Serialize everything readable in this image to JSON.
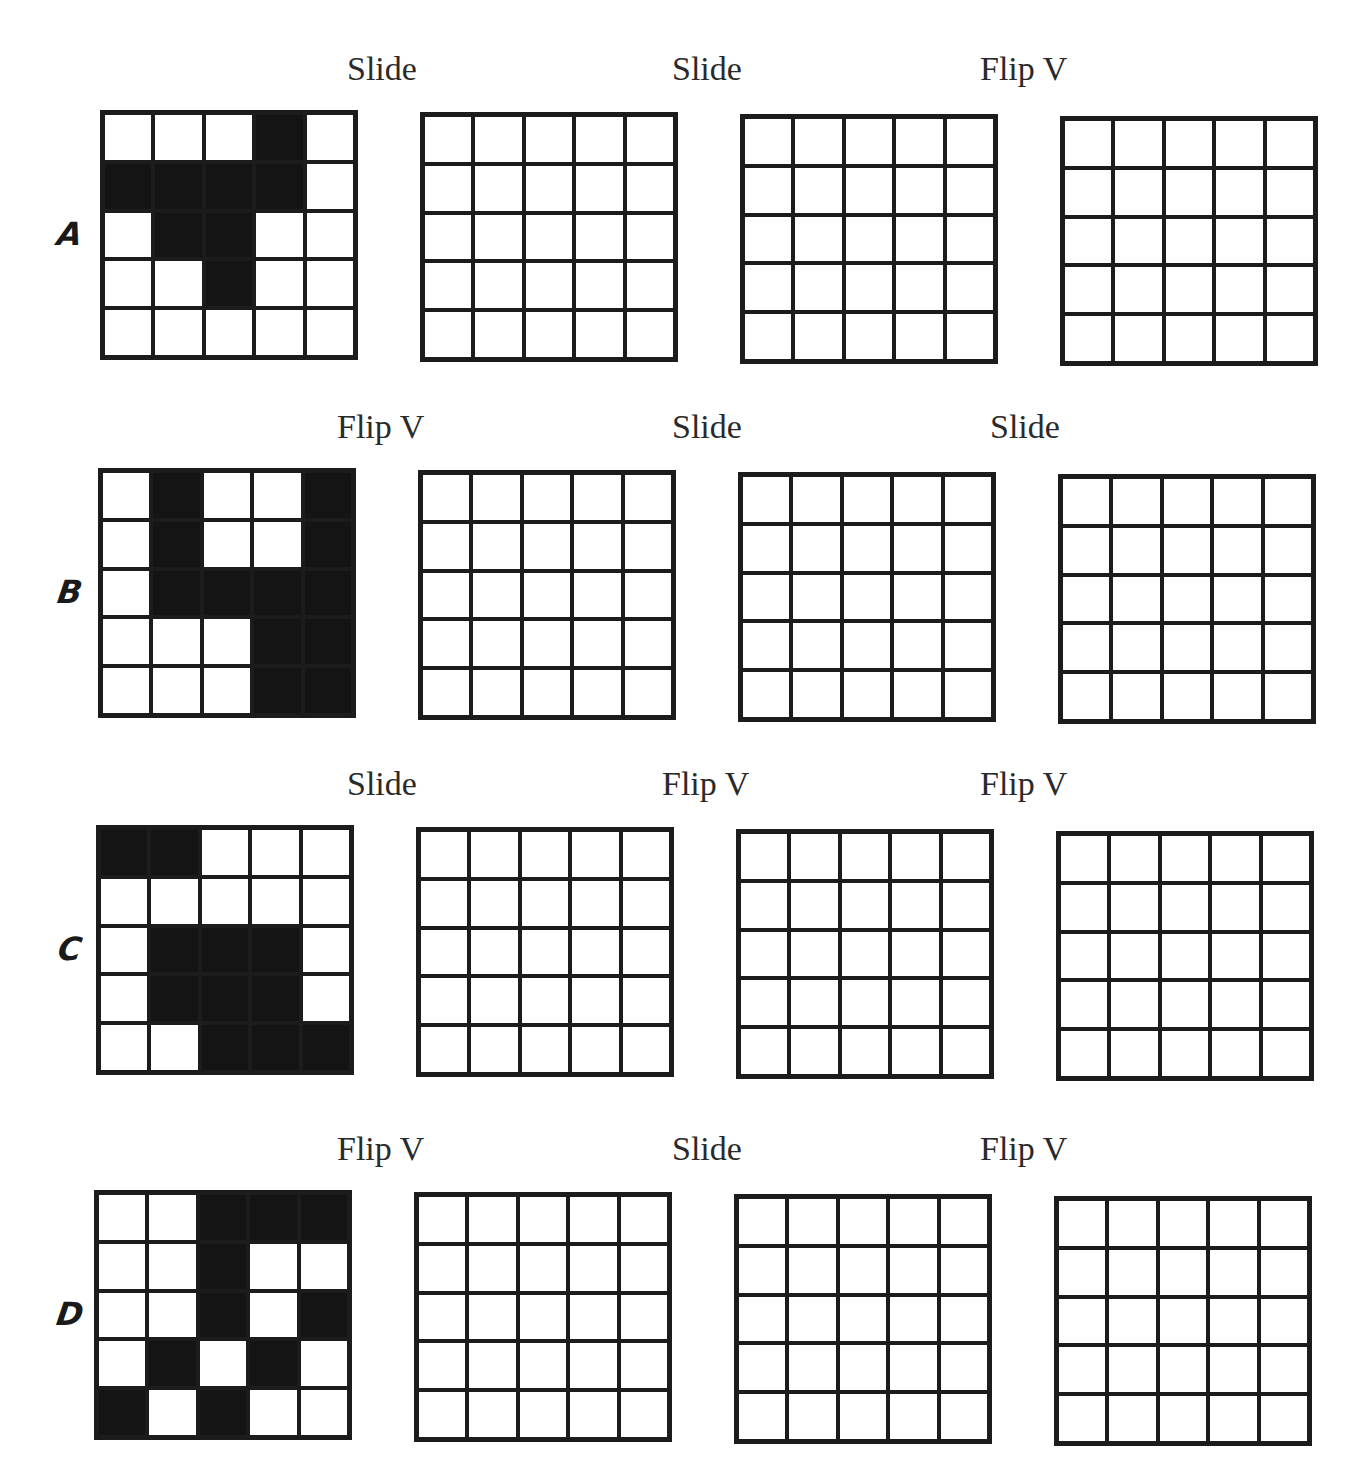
{
  "worksheet": {
    "rows": [
      {
        "letter": "A",
        "operations": [
          "Slide",
          "Slide",
          "Flip V"
        ],
        "start_pattern": [
          [
            0,
            0,
            0,
            1,
            0
          ],
          [
            1,
            1,
            1,
            1,
            0
          ],
          [
            0,
            1,
            1,
            0,
            0
          ],
          [
            0,
            0,
            1,
            0,
            0
          ],
          [
            0,
            0,
            0,
            0,
            0
          ]
        ]
      },
      {
        "letter": "B",
        "operations": [
          "Flip V",
          "Slide",
          "Slide"
        ],
        "start_pattern": [
          [
            0,
            1,
            0,
            0,
            1
          ],
          [
            0,
            1,
            0,
            0,
            1
          ],
          [
            0,
            1,
            1,
            1,
            1
          ],
          [
            0,
            0,
            0,
            1,
            1
          ],
          [
            0,
            0,
            0,
            1,
            1
          ]
        ]
      },
      {
        "letter": "C",
        "operations": [
          "Slide",
          "Flip V",
          "Flip V"
        ],
        "start_pattern": [
          [
            1,
            1,
            0,
            0,
            0
          ],
          [
            0,
            0,
            0,
            0,
            0
          ],
          [
            0,
            1,
            1,
            1,
            0
          ],
          [
            0,
            1,
            1,
            1,
            0
          ],
          [
            0,
            0,
            1,
            1,
            1
          ]
        ]
      },
      {
        "letter": "D",
        "operations": [
          "Flip V",
          "Slide",
          "Flip V"
        ],
        "start_pattern": [
          [
            0,
            0,
            1,
            1,
            1
          ],
          [
            0,
            0,
            1,
            0,
            0
          ],
          [
            0,
            0,
            1,
            0,
            1
          ],
          [
            0,
            1,
            0,
            1,
            0
          ],
          [
            1,
            0,
            1,
            0,
            0
          ]
        ]
      }
    ],
    "grid_size": 5,
    "colors": {
      "ink": "#141414",
      "paper": "#ffffff"
    }
  }
}
